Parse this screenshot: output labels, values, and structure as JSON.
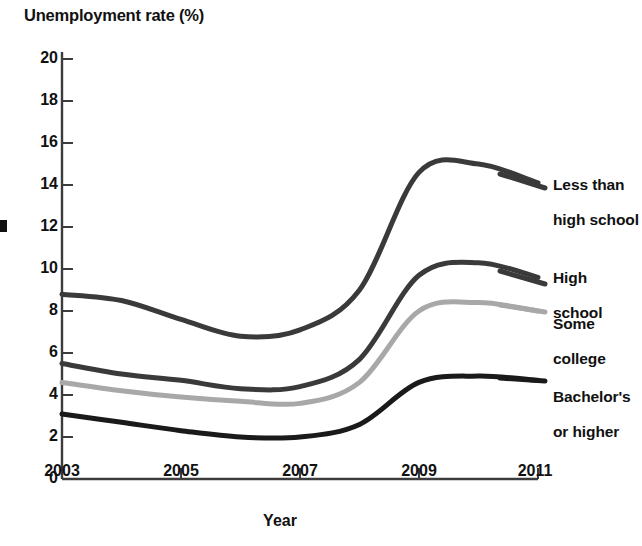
{
  "chart_data": {
    "type": "line",
    "title": "",
    "ylabel": "Unemployment rate (%)",
    "xlabel": "Year",
    "xlim": [
      2003,
      2011
    ],
    "ylim": [
      0,
      20
    ],
    "xticks": [
      "2003",
      "2005",
      "2007",
      "2009",
      "2011"
    ],
    "yticks": [
      "0",
      "2",
      "4",
      "6",
      "8",
      "10",
      "12",
      "14",
      "16",
      "18",
      "20"
    ],
    "grid": false,
    "legend_position": "right-inline",
    "x": [
      2003,
      2004,
      2005,
      2006,
      2007,
      2008,
      2009,
      2010,
      2011
    ],
    "series": [
      {
        "name": "Less than high school",
        "label_line1": "Less than",
        "label_line2": "high school",
        "color": "#3a3a3a",
        "values": [
          8.8,
          8.5,
          7.6,
          6.8,
          7.1,
          9.0,
          14.6,
          15.0,
          14.1
        ]
      },
      {
        "name": "High school",
        "label_line1": "High",
        "label_line2": "school",
        "color": "#3a3a3a",
        "values": [
          5.5,
          5.0,
          4.7,
          4.3,
          4.4,
          5.7,
          9.7,
          10.3,
          9.6
        ]
      },
      {
        "name": "Some college",
        "label_line1": "Some",
        "label_line2": "college",
        "color": "#a8a8a8",
        "values": [
          4.6,
          4.2,
          3.9,
          3.7,
          3.6,
          4.6,
          8.0,
          8.4,
          8.0
        ]
      },
      {
        "name": "Bachelor's or higher",
        "label_line1": "Bachelor's",
        "label_line2": "or higher",
        "color": "#1a1a1a",
        "values": [
          3.1,
          2.7,
          2.3,
          2.0,
          2.0,
          2.6,
          4.6,
          4.9,
          4.7
        ]
      }
    ]
  },
  "axis": {
    "y_title": "Unemployment rate (%)",
    "x_title": "Year",
    "y_labels": [
      "20",
      "18",
      "16",
      "14",
      "12",
      "10",
      "8",
      "6",
      "4",
      "2",
      "0"
    ],
    "x_labels": [
      "2003",
      "2005",
      "2007",
      "2009",
      "2011"
    ]
  },
  "legend": {
    "items": [
      {
        "line1": "Less than",
        "line2": "high school"
      },
      {
        "line1": "High",
        "line2": "school"
      },
      {
        "line1": "Some",
        "line2": "college"
      },
      {
        "line1": "Bachelor's",
        "line2": "or higher"
      }
    ]
  }
}
